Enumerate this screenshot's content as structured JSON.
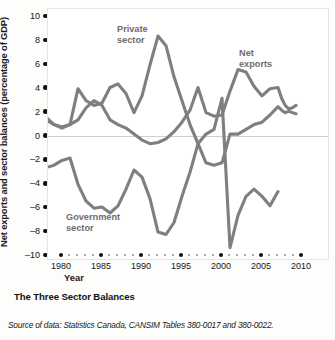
{
  "figure": {
    "title": "The Three Sector Balances",
    "source": "Source of data: Statistics Canada, CANSIM Tables 380-0017 and 380-0022.",
    "line_color": "#7f7f7f",
    "zero_line_color": "#cfcfcf",
    "tick_color": "#111111"
  },
  "chart_data": {
    "type": "line",
    "title": "The Three Sector Balances",
    "xlabel": "Year",
    "ylabel": "Net exports and sector balances (percentage of GDP)",
    "xlim": [
      1978,
      2010
    ],
    "ylim": [
      -10,
      10
    ],
    "xticks": [
      1980,
      1985,
      1990,
      1995,
      2000,
      2005,
      2010
    ],
    "yticks": [
      10,
      8,
      6,
      4,
      2,
      0,
      -2,
      -4,
      -6,
      -8,
      -10
    ],
    "grid": false,
    "legend": "inline-annotations",
    "x": [
      1978,
      1979,
      1980,
      1981,
      1982,
      1983,
      1984,
      1985,
      1986,
      1987,
      1988,
      1989,
      1990,
      1991,
      1992,
      1993,
      1994,
      1995,
      1996,
      1997,
      1998,
      1999,
      2000,
      2001,
      2002,
      2003,
      2004,
      2005,
      2006,
      2007
    ],
    "series": [
      {
        "name": "Private sector",
        "label": "Private\nsector",
        "values": [
          1.6,
          1.0,
          0.7,
          1.0,
          4.0,
          3.0,
          2.6,
          2.8,
          4.1,
          4.4,
          3.6,
          2.0,
          3.4,
          6.0,
          8.4,
          7.6,
          5.0,
          3.0,
          1.0,
          -0.6,
          -2.2,
          -2.4,
          -2.2,
          0.2,
          0.2,
          0.6,
          1.0,
          1.2,
          1.8,
          2.5
        ]
      },
      {
        "name": "Net exports",
        "label": "Net\nexports",
        "values": [
          1.4,
          1.0,
          0.8,
          1.0,
          1.4,
          2.4,
          3.0,
          2.6,
          1.4,
          1.0,
          0.7,
          0.2,
          -0.3,
          -0.6,
          -0.5,
          -0.2,
          0.4,
          1.2,
          2.2,
          4.1,
          2.0,
          1.7,
          1.8,
          3.8,
          5.6,
          5.4,
          4.2,
          3.4,
          4.0,
          4.1
        ]
      },
      {
        "name": "Government sector",
        "label": "Government\nsector",
        "values": [
          -2.6,
          -2.4,
          -2.0,
          -1.8,
          -4.0,
          -5.4,
          -6.0,
          -5.9,
          -6.4,
          -5.8,
          -4.4,
          -2.8,
          -3.4,
          -5.2,
          -8.0,
          -8.2,
          -7.2,
          -5.0,
          -3.0,
          -0.6,
          0.2,
          0.6,
          3.2,
          -9.3,
          -6.6,
          -5.0,
          -4.4,
          -5.0,
          -5.8,
          -4.6
        ]
      }
    ],
    "series_right_tail": {
      "Net exports": [
        3.2,
        2.6,
        2.3,
        2.4,
        2.6
      ],
      "Private sector": [
        2.2,
        2.0,
        2.1,
        2.0,
        1.9
      ]
    }
  },
  "axis": {
    "y_title": "Net exports and sector balances (percentage of GDP)",
    "x_title": "Year",
    "y_labels": [
      "10",
      "8",
      "6",
      "4",
      "2",
      "0",
      "-2",
      "-4",
      "-6",
      "-8",
      "-10"
    ],
    "x_labels": [
      "1980",
      "1985",
      "1990",
      "1995",
      "2000",
      "2005",
      "2010"
    ]
  },
  "annotations": {
    "private": "Private\nsector",
    "net_exports": "Net\nexports",
    "government": "Government\nsector"
  }
}
